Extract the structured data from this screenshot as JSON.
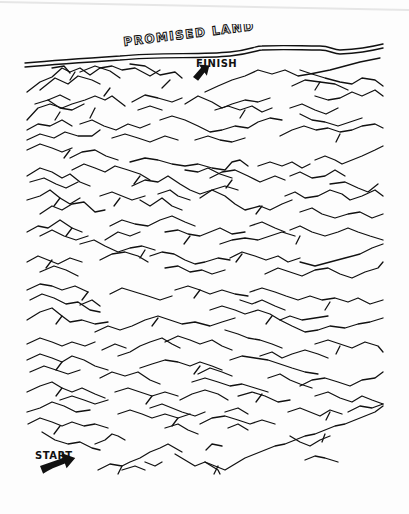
{
  "maze": {
    "title": "PROMISED LAND",
    "finish_label": "FINISH",
    "start_label": "START",
    "ink_color": "#111111",
    "paper_color": "#fdfdfd",
    "icons": {
      "finish_arrow": "arrow-up-right-icon",
      "start_arrow": "arrow-right-icon"
    },
    "river": {
      "top": "M25,63 C60,60 90,58 120,56 C160,52 200,55 230,52 C250,50 255,46 262,46 C285,45 300,46 320,46 C330,46 333,50 340,50 C360,49 375,46 383,44",
      "bottom": "M25,67 C60,64 90,62 120,60 C160,56 200,59 230,56 C250,54 258,50 262,50 C285,49 300,50 320,50 C330,50 333,54 340,54 C360,53 375,50 383,48"
    },
    "ridges": [
      "27,92 40,82 52,77 62,68 70,72 80,68 90,75 100,68 112,66 122,70 135,68 150,76 160,70",
      "40,90 55,78 68,84 78,76 92,80 100,84",
      "80,72 95,66 110,71 120,78",
      "52,68 64,66 70,73",
      "130,64 145,66 160,75 175,72 182,78",
      "205,92 218,86 232,80 245,76 258,70 272,74 285,70 298,76 310,74 320,72 330,70 345,66 360,62 380,58",
      "292,86 305,80 320,82 335,84 348,90",
      "300,70 312,74 325,78 340,82 352,84 362,78 375,80 383,86",
      "27,120 38,108 50,104 62,108 72,104 85,100 95,96 105,100 112,96 125,106",
      "35,104 48,100 60,108 72,110 84,104",
      "48,100 60,95 70,100",
      "132,102 145,95 158,98 172,102 182,98",
      "138,110 150,106 162,110",
      "185,104 198,96 212,102 222,108 232,104 245,100 258,102 270,98",
      "215,110 228,106 240,110 252,106 262,112 272,108",
      "290,108 302,104 315,110 326,114 338,108",
      "315,96 328,100 340,98 352,92 362,96 375,90 383,96",
      "27,130 38,124 50,126 62,120 72,126",
      "27,140 40,134 54,138 65,132 78,136 92,136 100,130",
      "80,124 92,120 104,126 116,130 128,124 140,128 150,124",
      "112,138 125,134 138,138 150,142 165,136 178,140",
      "160,120 172,116 185,120 198,126 210,132 222,130 235,126 248,128 258,122 270,118 282,120",
      "195,140 208,136 220,140 232,142 245,138",
      "280,136 292,130 304,126 316,130 328,128 340,132 352,130 362,126 375,124 383,128",
      "300,114 312,120 325,122 338,126 350,122 362,118",
      "27,150 40,144 52,148 62,152 72,148",
      "70,158 82,152 95,150 106,156 118,160",
      "130,162 145,158 158,160 172,164 185,166 198,164 212,168 225,170 232,162 240,160 248,166",
      "258,166 270,162 282,166 292,162 302,168 310,164",
      "315,160 325,156 335,160 342,164 352,160 362,156 375,150 383,146",
      "27,176 40,168 52,172 62,178 70,174 80,182 90,186",
      "30,182 44,178 56,184 66,188 78,182",
      "72,170 84,164 95,168 105,172 115,166 128,170 140,174 150,180",
      "132,186 145,180 158,182 168,176 180,184 190,190 200,194 212,190 225,186 238,190",
      "185,170 198,172 208,168 220,174 232,178",
      "210,178 222,172 235,170 248,176 260,182 275,176 285,180",
      "290,176 300,172 312,178 325,176 335,170 345,176",
      "330,184 345,182 358,188 368,192 378,184",
      "27,200 40,196 50,190 60,198 70,204 80,198",
      "40,214 52,206 62,210 72,204 84,202 95,212 105,210",
      "100,196 112,192 122,196 132,200 145,196",
      "158,194 170,190 178,196 190,200",
      "140,200 150,206 162,198 172,206 182,210",
      "200,198 212,190 225,196 235,204 245,210 260,206 270,210 282,204 292,200",
      "285,196 295,192 305,198 318,196 330,190 342,194 350,200 362,196 375,190 383,196",
      "300,212 312,208 322,214 335,218 348,214 360,212 372,218 383,214",
      "27,232 38,226 48,228 60,220 72,228 82,232",
      "40,236 52,230 64,236 76,240 88,236",
      "110,226 122,220 135,224 148,226 160,220 172,216 185,222 195,226",
      "105,240 118,232 130,236 140,232",
      "165,232 178,230 188,234 200,236 210,232 220,228 232,234 245,232",
      "220,244 232,240 245,238 258,240 270,236 282,232 295,236",
      "250,226 262,222 275,228 285,232",
      "290,230 300,226 312,232 325,236 338,232 348,228 358,232 370,236 383,240",
      "27,262 38,256 48,260 58,264 70,258 82,262",
      "40,272 54,266 66,270 78,276",
      "80,244 94,240 105,246 118,252 130,248 142,246 155,250",
      "100,260 112,254 125,252 138,256 148,262",
      "150,256 162,252 174,254 185,260 195,264 205,262 218,258 230,260",
      "165,268 178,266 190,272 202,270 212,274 225,270",
      "230,258 242,252 255,256 266,260 278,256 288,262 300,258",
      "265,274 278,268 290,272 302,276 315,270 328,268 340,274 352,278 365,272 378,268 383,262",
      "300,262 315,266 330,262 345,258 360,254 372,248 383,244",
      "27,290 40,284 52,286 62,290 75,286 88,292",
      "30,300 42,294 54,298 66,304 78,302 90,310 100,312",
      "110,294 122,288 135,292 148,296 160,300 172,296",
      "175,290 188,286 200,290 210,294 222,290 235,294 248,296",
      "250,292 262,288 275,292 286,296 298,300 310,296 322,300 335,298 348,302 358,298 370,304 383,300",
      "240,300 252,304 262,300 275,306 285,310",
      "27,320 40,312 52,308 62,316 70,322 82,320 95,324 108,322",
      "80,305 92,300 100,306",
      "95,332 108,326 120,330 132,326 145,320 158,316 170,320 182,324 195,322 210,326 222,322 235,318",
      "210,310 222,306 235,310 245,314 258,310 270,314 280,320 290,316 302,320 315,318 328,316",
      "280,320 292,326 305,332 318,330 330,326 345,328 358,324 370,322 383,318",
      "27,344 40,338 52,342 62,346 72,342 85,346 95,342",
      "102,350 115,344 126,348",
      "165,342 178,336 190,340 200,344 212,340 222,346 232,350",
      "225,330 238,334 248,338 260,340 272,344 282,348",
      "260,356 272,352 282,358 292,354 305,350 318,354 328,358",
      "315,344 328,340 340,344 352,348 365,342 378,346 383,352",
      "27,360 40,354 52,358 62,362 72,356 84,360 95,366 108,370",
      "30,372 44,366 56,370 68,374 80,370",
      "118,356 130,352 140,346 150,342 162,338 172,344 180,348",
      "140,368 152,364 165,360 178,362 190,366 200,362 212,366 222,370",
      "198,374 210,368 222,372 232,376",
      "230,360 242,356 255,358 268,360 280,364 292,368 305,372 318,374",
      "300,386 312,380 325,378 338,382 350,386 362,380 375,378 383,372",
      "27,392 40,386 52,382 62,388 72,392 82,388 95,394 105,398",
      "60,400 72,396 84,400 95,404 108,400",
      "100,378 112,372 125,376 138,372 150,380 160,384",
      "115,392 128,388 140,392 152,396 165,392 178,396",
      "180,400 192,394 205,390 218,394 228,400",
      "192,382 205,378 218,382 230,386 242,384 255,388 268,392",
      "238,396 252,392 265,396 278,402 290,400",
      "268,378 280,374 290,380 300,384 312,388",
      "315,396 328,392 340,398 352,402 362,396 372,400 383,404",
      "27,412 40,408 52,402 64,406 76,412 90,410",
      "28,424 40,418 52,422 62,426 72,422 84,426 95,424 108,428",
      "118,414 130,410 142,414 152,418 165,414 178,418 190,414",
      "150,408 162,404 172,408 182,412 195,416 205,412",
      "200,424 212,418 225,416 238,420 250,424 262,420 275,424",
      "225,412 238,408 248,414",
      "288,412 300,408 310,412 320,416 330,410 342,414",
      "348,412 360,406 372,408 383,404",
      "42,432 55,440 68,444 80,442 92,448 100,450",
      "95,444 105,440 112,434 118,436 125,440",
      "165,428 178,424 188,430 198,434",
      "228,428 238,424 248,430",
      "206,450 212,444 222,446",
      "98,470 110,464 122,466 130,462 140,458 150,452 160,448 168,444 175,448 182,452",
      "122,470 135,466 145,470",
      "145,462 155,466 162,462",
      "175,454 185,460 195,466 205,462 215,466 225,470 235,464 245,458 255,454 265,450 275,446 285,444 295,440 305,436 315,434 325,430 335,426 345,424 355,420 365,416 375,412 383,406",
      "205,462 218,470 220,474",
      "290,436 300,442 310,446 320,440 330,436",
      "305,460 315,456 325,458 338,462"
    ],
    "ridge_spurs": [
      "75,72 70,80",
      "110,88 104,96",
      "170,80 162,88",
      "60,112 55,120",
      "95,108 90,118",
      "245,110 240,118",
      "320,82 315,90",
      "70,150 64,158",
      "140,176 134,184",
      "232,180 226,188",
      "340,134 336,142",
      "60,198 54,206",
      "120,198 114,206",
      "262,206 256,214",
      "72,228 66,236",
      "190,236 184,244",
      "300,236 296,244",
      "52,260 46,268",
      "145,250 140,258",
      "242,254 236,262",
      "88,292 82,300",
      "200,290 194,298",
      "330,302 325,310",
      "62,316 56,324",
      "158,318 152,326",
      "272,316 266,324",
      "62,362 56,370",
      "200,366 194,374",
      "340,346 336,354",
      "62,388 56,396",
      "152,396 146,404",
      "262,394 256,402",
      "60,426 54,434",
      "178,418 172,426",
      "330,412 326,420",
      "122,466 118,474",
      "218,466 214,474",
      "325,434 322,442"
    ]
  }
}
